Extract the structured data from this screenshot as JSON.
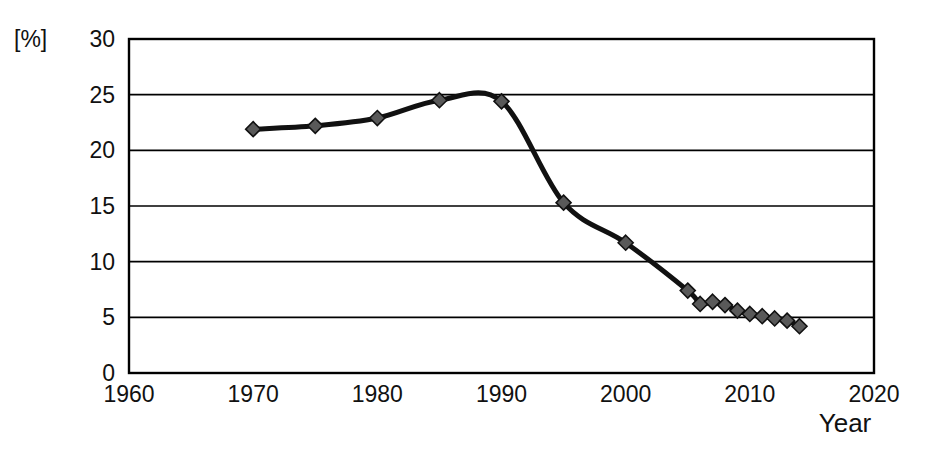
{
  "chart_data": {
    "type": "line",
    "title": "",
    "xlabel": "Year",
    "ylabel": "",
    "yunit": "[%]",
    "xlim": [
      1960,
      2020
    ],
    "ylim": [
      0,
      30
    ],
    "xticks": [
      1960,
      1970,
      1980,
      1990,
      2000,
      2010,
      2020
    ],
    "yticks": [
      0,
      5,
      10,
      15,
      20,
      25,
      30
    ],
    "grid": "horizontal",
    "legend": "none",
    "series": [
      {
        "name": "share",
        "marker": "diamond",
        "marker_color": "#595959",
        "line_color": "#111111",
        "x": [
          1970,
          1975,
          1980,
          1985,
          1990,
          1995,
          2000,
          2005,
          2006,
          2007,
          2008,
          2009,
          2010,
          2011,
          2012,
          2013,
          2014
        ],
        "values": [
          21.9,
          22.2,
          22.9,
          24.5,
          24.4,
          15.3,
          11.7,
          7.4,
          6.2,
          6.4,
          6.1,
          5.6,
          5.3,
          5.1,
          4.9,
          4.7,
          4.2
        ]
      }
    ]
  },
  "axes": {
    "y_unit_text": "[%]",
    "x_title_text": "Year",
    "y_tick_texts": [
      "30",
      "25",
      "20",
      "15",
      "10",
      "5",
      "0"
    ],
    "x_tick_texts": [
      "1960",
      "1970",
      "1980",
      "1990",
      "2000",
      "2010",
      "2020"
    ]
  },
  "colors": {
    "line": "#111111",
    "marker_fill": "#595959",
    "marker_stroke": "#111111",
    "frame": "#000000",
    "background": "#ffffff"
  }
}
